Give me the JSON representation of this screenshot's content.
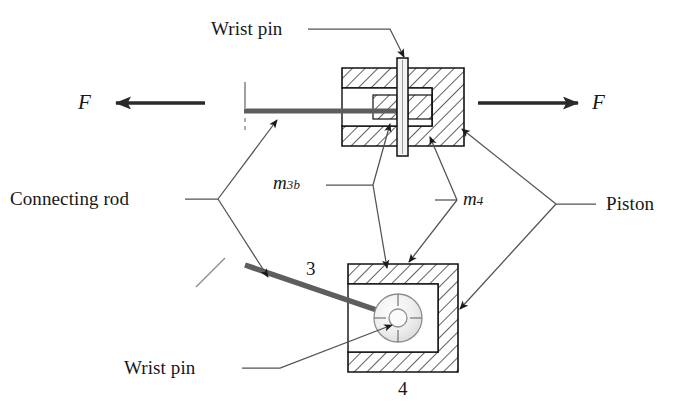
{
  "figure": {
    "type": "engineering-cross-section-diagram",
    "background_color": "#ffffff",
    "line_color": "#1a1a1a",
    "hatch_color": "#2b2b2b",
    "rod_color": "#5a5a5a",
    "leader_color": "#4c4c55"
  },
  "labels": {
    "wrist_pin_top": "Wrist pin",
    "wrist_pin_bottom": "Wrist pin",
    "connecting_rod": "Connecting rod",
    "piston": "Piston",
    "force_left": "F",
    "force_right": "F",
    "mass_rod": {
      "base": "m",
      "sub": "3b"
    },
    "mass_piston": {
      "base": "m",
      "sub": "4"
    },
    "link_3": "3",
    "link_4": "4"
  },
  "parts": {
    "upper_assembly": {
      "name": "piston-cross-section-upper",
      "outer": {
        "x": 342,
        "y": 68,
        "w": 122,
        "h": 78
      },
      "bore_opening_side": "left",
      "inner_cavity": {
        "x": 373,
        "y": 95,
        "w": 59,
        "h": 30
      }
    },
    "lower_assembly": {
      "name": "piston-cross-section-lower",
      "outer": {
        "x": 348,
        "y": 264,
        "w": 110,
        "h": 108
      },
      "open_side": "left",
      "hub": {
        "cx": 398,
        "cy": 318,
        "r": 24
      }
    },
    "wrist_pin": {
      "x": 397,
      "y": 58,
      "w": 11,
      "h": 98
    },
    "connecting_rod_upper": {
      "x1": 244,
      "y1": 111,
      "x2": 390,
      "y2": 111
    },
    "connecting_rod_lower": {
      "x1": 245,
      "y1": 264,
      "x2": 398,
      "y2": 318
    }
  },
  "arrows": {
    "force_left": {
      "from_x": 200,
      "from_y": 103,
      "to_x": 112,
      "to_y": 103
    },
    "force_right": {
      "from_x": 480,
      "from_y": 103,
      "to_x": 580,
      "to_y": 103
    }
  }
}
